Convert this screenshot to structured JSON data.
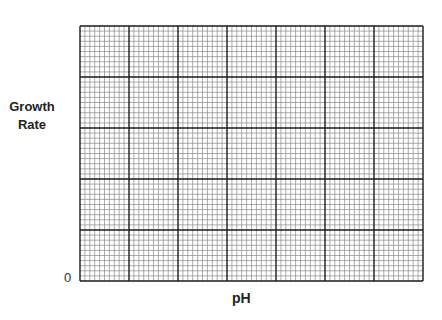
{
  "chart_data": {
    "type": "line",
    "title": "",
    "xlabel": "pH",
    "ylabel": "Growth Rate",
    "y_tick_labels": [
      "0"
    ],
    "x_tick_labels": [],
    "series": [],
    "grid": {
      "on": true,
      "major_columns": 7,
      "major_rows": 5,
      "minor_per_major": 10
    },
    "legend": null,
    "note": "Blank graph grid with no plotted data"
  },
  "labels": {
    "ylabel_line1": "Growth",
    "ylabel_line2": "Rate",
    "zero": "0",
    "xlabel": "pH"
  },
  "colors": {
    "major_line": "#1a1a1a",
    "minor_line": "#8a8a8a",
    "background": "#ffffff"
  }
}
